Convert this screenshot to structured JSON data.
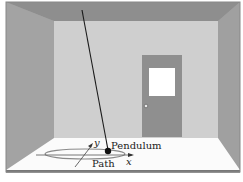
{
  "diagram": {
    "title": "",
    "labels": {
      "pendulum": "Pendulum",
      "path": "Path",
      "x_axis": "x",
      "y_axis": "y"
    },
    "colors": {
      "ceiling": "#8e8e8e",
      "side_wall": "#9c9c9c",
      "back_wall": "#cfcfcf",
      "floor": "#fbfbfb",
      "door": "#8f8f8f",
      "door_window": "#ffffff",
      "frame": "#6a6a6a",
      "string": "#1a1a1a",
      "bob": "#111111",
      "path": "#888888"
    },
    "elements": [
      "room",
      "door",
      "door-window",
      "door-knob",
      "pendulum-string",
      "pendulum-bob",
      "elliptical-path",
      "x-axis",
      "y-axis"
    ]
  }
}
